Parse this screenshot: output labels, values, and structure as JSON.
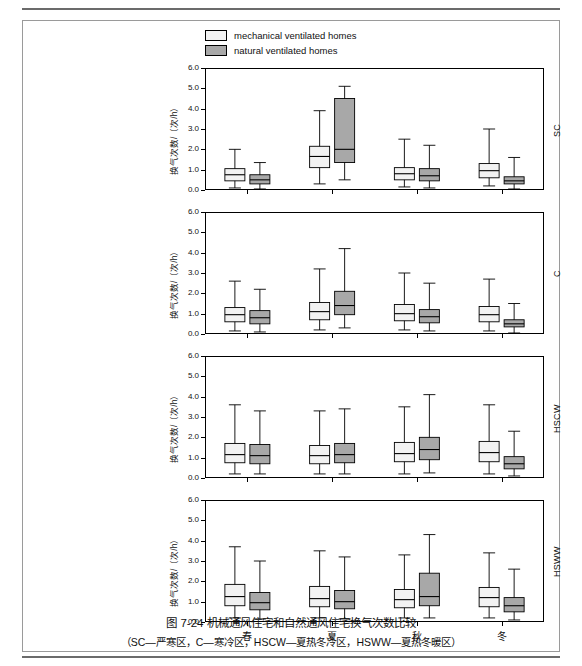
{
  "figure": {
    "caption_main": "图 7-24   机械通风住宅和自然通风住宅换气次数比较",
    "caption_sub": "（SC—严寒区，C—寒冷区，HSCW—夏热冬冷区，HSWW—夏热冬暖区）",
    "caption_number": "图 7-24"
  },
  "legend": {
    "items": [
      {
        "label": "mechanical ventilated homes",
        "color": "#f2f2f2",
        "key": "mechanical"
      },
      {
        "label": "natural ventilated homes",
        "color": "#a8a8a8",
        "key": "natural"
      }
    ]
  },
  "chart_data": {
    "type": "box",
    "title": "机械通风住宅和自然通风住宅换气次数比较",
    "xlabel": "",
    "ylabel": "换气次数/（次/h）",
    "ylim": [
      0.0,
      6.0
    ],
    "yticks": [
      "0.0",
      "1.0",
      "2.0",
      "3.0",
      "4.0",
      "5.0",
      "6.0"
    ],
    "categories": [
      "春",
      "夏",
      "秋",
      "冬"
    ],
    "legend_position": "top-center",
    "grid": false,
    "panels": [
      {
        "name": "SC",
        "label": "SC",
        "series": [
          {
            "name": "mechanical ventilated homes",
            "color": "#f2f2f2",
            "boxes": [
              {
                "category": "春",
                "whisker_low": 0.1,
                "q1": 0.45,
                "median": 0.75,
                "q3": 1.05,
                "whisker_high": 2.0
              },
              {
                "category": "夏",
                "whisker_low": 0.3,
                "q1": 1.1,
                "median": 1.65,
                "q3": 2.15,
                "whisker_high": 3.9
              },
              {
                "category": "秋",
                "whisker_low": 0.15,
                "q1": 0.5,
                "median": 0.8,
                "q3": 1.1,
                "whisker_high": 2.5
              },
              {
                "category": "冬",
                "whisker_low": 0.2,
                "q1": 0.6,
                "median": 0.95,
                "q3": 1.3,
                "whisker_high": 3.0
              }
            ]
          },
          {
            "name": "natural ventilated homes",
            "color": "#a8a8a8",
            "boxes": [
              {
                "category": "春",
                "whisker_low": 0.05,
                "q1": 0.3,
                "median": 0.5,
                "q3": 0.75,
                "whisker_high": 1.35
              },
              {
                "category": "夏",
                "whisker_low": 0.5,
                "q1": 1.35,
                "median": 2.0,
                "q3": 4.5,
                "whisker_high": 5.1
              },
              {
                "category": "秋",
                "whisker_low": 0.1,
                "q1": 0.45,
                "median": 0.7,
                "q3": 1.05,
                "whisker_high": 2.2
              },
              {
                "category": "冬",
                "whisker_low": 0.05,
                "q1": 0.3,
                "median": 0.45,
                "q3": 0.65,
                "whisker_high": 1.6
              }
            ]
          }
        ]
      },
      {
        "name": "C",
        "label": "C",
        "series": [
          {
            "name": "mechanical ventilated homes",
            "color": "#f2f2f2",
            "boxes": [
              {
                "category": "春",
                "whisker_low": 0.15,
                "q1": 0.6,
                "median": 0.95,
                "q3": 1.3,
                "whisker_high": 2.6
              },
              {
                "category": "夏",
                "whisker_low": 0.2,
                "q1": 0.7,
                "median": 1.1,
                "q3": 1.55,
                "whisker_high": 3.2
              },
              {
                "category": "秋",
                "whisker_low": 0.2,
                "q1": 0.65,
                "median": 1.0,
                "q3": 1.45,
                "whisker_high": 3.0
              },
              {
                "category": "冬",
                "whisker_low": 0.15,
                "q1": 0.6,
                "median": 0.95,
                "q3": 1.35,
                "whisker_high": 2.7
              }
            ]
          },
          {
            "name": "natural ventilated homes",
            "color": "#a8a8a8",
            "boxes": [
              {
                "category": "春",
                "whisker_low": 0.1,
                "q1": 0.5,
                "median": 0.8,
                "q3": 1.15,
                "whisker_high": 2.2
              },
              {
                "category": "夏",
                "whisker_low": 0.3,
                "q1": 0.95,
                "median": 1.4,
                "q3": 2.1,
                "whisker_high": 4.2
              },
              {
                "category": "秋",
                "whisker_low": 0.15,
                "q1": 0.55,
                "median": 0.85,
                "q3": 1.2,
                "whisker_high": 2.5
              },
              {
                "category": "冬",
                "whisker_low": 0.05,
                "q1": 0.35,
                "median": 0.5,
                "q3": 0.7,
                "whisker_high": 1.5
              }
            ]
          }
        ]
      },
      {
        "name": "HSCW",
        "label": "HSCW",
        "series": [
          {
            "name": "mechanical ventilated homes",
            "color": "#f2f2f2",
            "boxes": [
              {
                "category": "春",
                "whisker_low": 0.2,
                "q1": 0.75,
                "median": 1.15,
                "q3": 1.7,
                "whisker_high": 3.6
              },
              {
                "category": "夏",
                "whisker_low": 0.2,
                "q1": 0.7,
                "median": 1.1,
                "q3": 1.6,
                "whisker_high": 3.3
              },
              {
                "category": "秋",
                "whisker_low": 0.2,
                "q1": 0.8,
                "median": 1.2,
                "q3": 1.75,
                "whisker_high": 3.5
              },
              {
                "category": "冬",
                "whisker_low": 0.2,
                "q1": 0.8,
                "median": 1.25,
                "q3": 1.8,
                "whisker_high": 3.6
              }
            ]
          },
          {
            "name": "natural ventilated homes",
            "color": "#a8a8a8",
            "boxes": [
              {
                "category": "春",
                "whisker_low": 0.2,
                "q1": 0.7,
                "median": 1.1,
                "q3": 1.65,
                "whisker_high": 3.3
              },
              {
                "category": "夏",
                "whisker_low": 0.2,
                "q1": 0.75,
                "median": 1.15,
                "q3": 1.7,
                "whisker_high": 3.4
              },
              {
                "category": "秋",
                "whisker_low": 0.25,
                "q1": 0.9,
                "median": 1.4,
                "q3": 2.0,
                "whisker_high": 4.1
              },
              {
                "category": "冬",
                "whisker_low": 0.1,
                "q1": 0.45,
                "median": 0.7,
                "q3": 1.05,
                "whisker_high": 2.3
              }
            ]
          }
        ]
      },
      {
        "name": "HSWW",
        "label": "HSWW",
        "series": [
          {
            "name": "mechanical ventilated homes",
            "color": "#f2f2f2",
            "boxes": [
              {
                "category": "春",
                "whisker_low": 0.2,
                "q1": 0.8,
                "median": 1.25,
                "q3": 1.85,
                "whisker_high": 3.7
              },
              {
                "category": "夏",
                "whisker_low": 0.2,
                "q1": 0.75,
                "median": 1.15,
                "q3": 1.75,
                "whisker_high": 3.5
              },
              {
                "category": "秋",
                "whisker_low": 0.2,
                "q1": 0.7,
                "median": 1.1,
                "q3": 1.6,
                "whisker_high": 3.3
              },
              {
                "category": "冬",
                "whisker_low": 0.2,
                "q1": 0.75,
                "median": 1.2,
                "q3": 1.7,
                "whisker_high": 3.4
              }
            ]
          },
          {
            "name": "natural ventilated homes",
            "color": "#a8a8a8",
            "boxes": [
              {
                "category": "春",
                "whisker_low": 0.15,
                "q1": 0.6,
                "median": 0.95,
                "q3": 1.45,
                "whisker_high": 3.0
              },
              {
                "category": "夏",
                "whisker_low": 0.15,
                "q1": 0.65,
                "median": 1.0,
                "q3": 1.55,
                "whisker_high": 3.2
              },
              {
                "category": "秋",
                "whisker_low": 0.2,
                "q1": 0.8,
                "median": 1.25,
                "q3": 2.4,
                "whisker_high": 4.3
              },
              {
                "category": "冬",
                "whisker_low": 0.1,
                "q1": 0.5,
                "median": 0.8,
                "q3": 1.2,
                "whisker_high": 2.6
              }
            ]
          }
        ]
      }
    ]
  }
}
